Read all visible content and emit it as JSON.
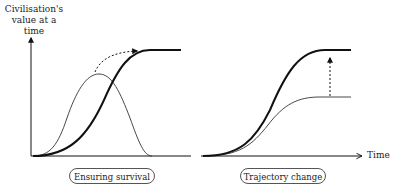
{
  "axes": {
    "y_label_line1": "Civilisation's",
    "y_label_line2": "value at a time",
    "x_label": "Time"
  },
  "panels": [
    {
      "id": "left",
      "label": "Ensuring survival",
      "description": "Thin bell curve (value lost without survival) and bold S-curve (value reached when survival is ensured); dashed curved arrow from bell peak to bold plateau."
    },
    {
      "id": "right",
      "label": "Trajectory change",
      "description": "Thin S-curve plateauing lower and bold S-curve plateauing higher; dashed vertical arrow from thin plateau up to bold plateau."
    }
  ],
  "colors": {
    "line": "#111111",
    "thin_line": "#333333",
    "pill_border": "#555555",
    "background": "#ffffff"
  }
}
